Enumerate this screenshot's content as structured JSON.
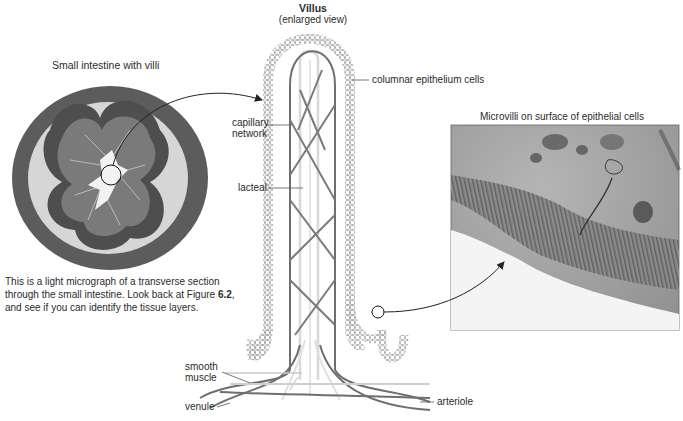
{
  "left_panel": {
    "title": "Small intestine with villi",
    "caption_part1": "This is a light micrograph of a transverse section through the small intestine. Look back at Figure ",
    "caption_figure_ref": "6.2",
    "caption_part2": ", and see if you can identify the tissue layers."
  },
  "center_panel": {
    "title": "Villus",
    "subtitle": "(enlarged view)",
    "labels": {
      "columnar_epithelium": "columnar epithelium cells",
      "capillary_network_line1": "capillary",
      "capillary_network_line2": "network",
      "lacteal": "lacteal",
      "smooth_muscle_line1": "smooth",
      "smooth_muscle_line2": "muscle",
      "venule": "venule",
      "arteriole": "arteriole"
    }
  },
  "right_panel": {
    "title": "Microvilli on surface of epithelial cells"
  },
  "colors": {
    "vessel_dark": "#6e6e6e",
    "vessel_light": "#c8c8c8",
    "lacteal": "#d6d6d6",
    "epithelium": "#9a9a9a",
    "micrograph_ring": "#5a5a5a",
    "micrograph_lumen": "#efefef",
    "em_background": "#a8a8a8"
  }
}
